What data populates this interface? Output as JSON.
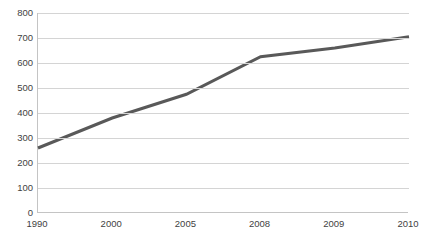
{
  "chart_data": {
    "type": "line",
    "title": "",
    "xlabel": "",
    "ylabel": "",
    "categories": [
      "1990",
      "2000",
      "2005",
      "2008",
      "2009",
      "2010"
    ],
    "values": [
      260,
      380,
      475,
      625,
      660,
      705
    ],
    "series": [
      {
        "name": "Series 1",
        "values": [
          260,
          380,
          475,
          625,
          660,
          705
        ]
      }
    ],
    "ylim": [
      0,
      800
    ],
    "y_ticks": [
      "0",
      "100",
      "200",
      "300",
      "400",
      "500",
      "600",
      "700",
      "800"
    ],
    "y_tick_values": [
      0,
      100,
      200,
      300,
      400,
      500,
      600,
      700,
      800
    ],
    "x_ticks": [
      "1990",
      "2000",
      "2005",
      "2008",
      "2009",
      "2010"
    ],
    "grid": true,
    "grid_axis": "y",
    "legend": false,
    "legend_position": "none",
    "markers": false,
    "colors": {
      "line": "#595959",
      "gridline": "#d4d4d4",
      "axis": "#c4c4c4",
      "text": "#3f3f3f",
      "background": "#ffffff"
    },
    "line_width": 3
  }
}
